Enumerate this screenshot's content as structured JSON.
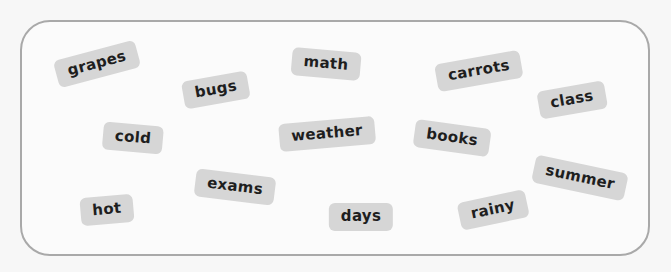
{
  "container": {
    "border_color": "#a9a9a9",
    "tile_color": "#d6d6d6",
    "text_color": "#1e1e1e"
  },
  "words": [
    {
      "text": "grapes",
      "x": 97,
      "y": 64,
      "rotation": -15
    },
    {
      "text": "bugs",
      "x": 216,
      "y": 90,
      "rotation": -10
    },
    {
      "text": "math",
      "x": 326,
      "y": 64,
      "rotation": 5
    },
    {
      "text": "carrots",
      "x": 479,
      "y": 71,
      "rotation": -10
    },
    {
      "text": "class",
      "x": 572,
      "y": 100,
      "rotation": -10
    },
    {
      "text": "cold",
      "x": 133,
      "y": 138,
      "rotation": 5
    },
    {
      "text": "weather",
      "x": 327,
      "y": 134,
      "rotation": -5
    },
    {
      "text": "books",
      "x": 452,
      "y": 138,
      "rotation": 8
    },
    {
      "text": "summer",
      "x": 580,
      "y": 178,
      "rotation": 12
    },
    {
      "text": "exams",
      "x": 235,
      "y": 187,
      "rotation": 7
    },
    {
      "text": "hot",
      "x": 107,
      "y": 210,
      "rotation": -5
    },
    {
      "text": "days",
      "x": 361,
      "y": 217,
      "rotation": 0
    },
    {
      "text": "rainy",
      "x": 493,
      "y": 210,
      "rotation": -12
    }
  ]
}
